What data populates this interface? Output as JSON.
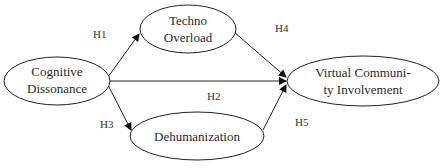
{
  "diagram": {
    "type": "path-model",
    "nodes": [
      {
        "id": "cognitive_dissonance",
        "lines": [
          "Cognitive",
          "Dissonance"
        ]
      },
      {
        "id": "techno_overload",
        "lines": [
          "Techno",
          "Overload"
        ]
      },
      {
        "id": "dehumanization",
        "lines": [
          "Dehumanization"
        ]
      },
      {
        "id": "virtual_community_involvement",
        "lines": [
          "Virtual Communi-",
          "ty Involvement"
        ]
      }
    ],
    "edges": [
      {
        "label": "H1",
        "from": "cognitive_dissonance",
        "to": "techno_overload"
      },
      {
        "label": "H2",
        "from": "cognitive_dissonance",
        "to": "virtual_community_involvement"
      },
      {
        "label": "H3",
        "from": "cognitive_dissonance",
        "to": "dehumanization"
      },
      {
        "label": "H4",
        "from": "techno_overload",
        "to": "virtual_community_involvement"
      },
      {
        "label": "H5",
        "from": "dehumanization",
        "to": "virtual_community_involvement"
      }
    ]
  }
}
